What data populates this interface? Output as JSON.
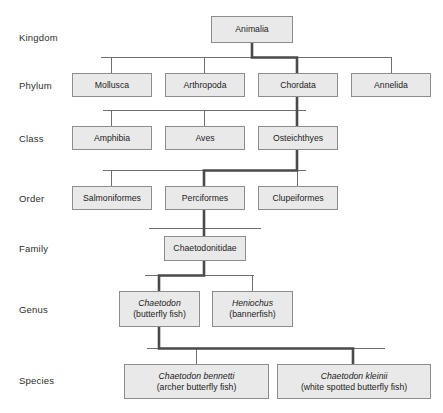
{
  "diagram": {
    "colors": {
      "box_fill": "#e9e9e9",
      "box_border": "#8d8d8d",
      "thin_line": "#6f6f6f",
      "highlight_line": "#4a4a4a",
      "text": "#1d1d1d",
      "background": "#ffffff"
    },
    "rank_labels": [
      {
        "name": "kingdom",
        "label": "Kingdom"
      },
      {
        "name": "phylum",
        "label": "Phylum"
      },
      {
        "name": "class",
        "label": "Class"
      },
      {
        "name": "order",
        "label": "Order"
      },
      {
        "name": "family",
        "label": "Family"
      },
      {
        "name": "genus",
        "label": "Genus"
      },
      {
        "name": "species",
        "label": "Species"
      }
    ],
    "levels": {
      "kingdom": {
        "nodes": [
          {
            "name": "animalia",
            "label": "Animalia",
            "highlighted": true
          }
        ]
      },
      "phylum": {
        "nodes": [
          {
            "name": "mollusca",
            "label": "Mollusca",
            "highlighted": false
          },
          {
            "name": "arthropoda",
            "label": "Arthropoda",
            "highlighted": false
          },
          {
            "name": "chordata",
            "label": "Chordata",
            "highlighted": true
          },
          {
            "name": "annelida",
            "label": "Annelida",
            "highlighted": false
          }
        ]
      },
      "class": {
        "nodes": [
          {
            "name": "amphibia",
            "label": "Amphibia",
            "highlighted": false
          },
          {
            "name": "aves",
            "label": "Aves",
            "highlighted": false
          },
          {
            "name": "osteichthyes",
            "label": "Osteichthyes",
            "highlighted": true
          }
        ]
      },
      "order": {
        "nodes": [
          {
            "name": "salmoniformes",
            "label": "Salmoniformes",
            "highlighted": false
          },
          {
            "name": "perciformes",
            "label": "Perciformes",
            "highlighted": true
          },
          {
            "name": "clupeiformes",
            "label": "Clupeiformes",
            "highlighted": false
          }
        ]
      },
      "family": {
        "nodes": [
          {
            "name": "chaetodonitidae",
            "label": "Chaetodonitidae",
            "highlighted": true
          }
        ]
      },
      "genus": {
        "nodes": [
          {
            "name": "chaetodon",
            "sci_name": "Chaetodon",
            "common_name": "(butterfly fish)",
            "highlighted": true
          },
          {
            "name": "heniochus",
            "sci_name": "Heniochus",
            "common_name": "(bannerfish)",
            "highlighted": false
          }
        ]
      },
      "species": {
        "nodes": [
          {
            "name": "chaetodon-bennetti",
            "sci_name": "Chaetodon bennetti",
            "common_name": "(archer butterfly fish)",
            "highlighted": false
          },
          {
            "name": "chaetodon-kleinii",
            "sci_name": "Chaetodon kleinii",
            "common_name": "(white spotted butterfly fish)",
            "highlighted": true
          }
        ]
      }
    }
  }
}
